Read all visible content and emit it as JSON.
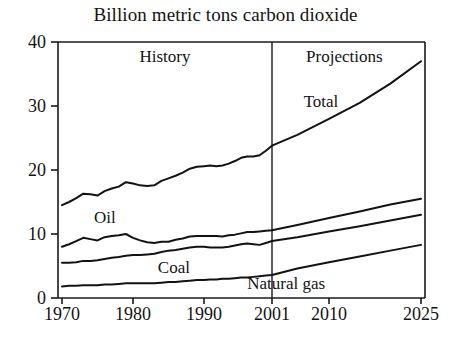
{
  "chart_data": {
    "type": "line",
    "title": "Billion metric tons carbon dioxide",
    "xlabel": "",
    "ylabel": "",
    "xlim": [
      1970,
      2025
    ],
    "ylim": [
      0,
      40
    ],
    "yticks": [
      0,
      10,
      20,
      30,
      40
    ],
    "xticks": [
      1970,
      1980,
      1990,
      2001,
      2010,
      2025
    ],
    "grid": false,
    "legend": "inline-labels",
    "annotations": [
      {
        "name": "history",
        "text": "History",
        "x": 1984.5,
        "y": 37.5
      },
      {
        "name": "projections",
        "text": "Projections",
        "x": 2012.5,
        "y": 37.5
      },
      {
        "name": "total",
        "text": "Total",
        "x": 2006,
        "y": 30.5
      },
      {
        "name": "oil",
        "text": "Oil",
        "x": 1974.5,
        "y": 12.3
      },
      {
        "name": "coal",
        "text": "Coal",
        "x": 1983.5,
        "y": 4.6
      },
      {
        "name": "natural-gas",
        "text": "Natural gas",
        "x": 1997,
        "y": 2.1
      }
    ],
    "divider": {
      "name": "history-projection-divider",
      "x": 2001
    },
    "series": [
      {
        "name": "Total",
        "x": [
          1970,
          1971,
          1972,
          1973,
          1974,
          1975,
          1976,
          1977,
          1978,
          1979,
          1980,
          1981,
          1982,
          1983,
          1984,
          1985,
          1986,
          1987,
          1988,
          1989,
          1990,
          1991,
          1992,
          1993,
          1994,
          1995,
          1996,
          1997,
          1998,
          1999,
          2000,
          2001,
          2005,
          2010,
          2015,
          2020,
          2025
        ],
        "values": [
          14.5,
          15.0,
          15.6,
          16.3,
          16.2,
          16.0,
          16.7,
          17.1,
          17.4,
          18.1,
          17.9,
          17.6,
          17.5,
          17.6,
          18.3,
          18.7,
          19.1,
          19.6,
          20.2,
          20.5,
          20.6,
          20.7,
          20.6,
          20.7,
          21.0,
          21.4,
          21.9,
          22.1,
          22.1,
          22.3,
          23.0,
          23.8,
          25.5,
          28.0,
          30.5,
          33.5,
          37.0
        ]
      },
      {
        "name": "Oil",
        "x": [
          1970,
          1971,
          1972,
          1973,
          1974,
          1975,
          1976,
          1977,
          1978,
          1979,
          1980,
          1981,
          1982,
          1983,
          1984,
          1985,
          1986,
          1987,
          1988,
          1989,
          1990,
          1991,
          1992,
          1993,
          1994,
          1995,
          1996,
          1997,
          1998,
          1999,
          2000,
          2001,
          2005,
          2010,
          2015,
          2020,
          2025
        ],
        "values": [
          8.0,
          8.4,
          8.9,
          9.4,
          9.2,
          9.0,
          9.5,
          9.7,
          9.8,
          10.0,
          9.4,
          9.0,
          8.7,
          8.6,
          8.8,
          8.8,
          9.1,
          9.3,
          9.6,
          9.7,
          9.7,
          9.7,
          9.7,
          9.6,
          9.8,
          9.9,
          10.1,
          10.3,
          10.3,
          10.4,
          10.5,
          10.6,
          11.4,
          12.5,
          13.5,
          14.6,
          15.5
        ]
      },
      {
        "name": "Coal",
        "x": [
          1970,
          1971,
          1972,
          1973,
          1974,
          1975,
          1976,
          1977,
          1978,
          1979,
          1980,
          1981,
          1982,
          1983,
          1984,
          1985,
          1986,
          1987,
          1988,
          1989,
          1990,
          1991,
          1992,
          1993,
          1994,
          1995,
          1996,
          1997,
          1998,
          1999,
          2000,
          2001,
          2005,
          2010,
          2015,
          2020,
          2025
        ],
        "values": [
          5.5,
          5.5,
          5.6,
          5.8,
          5.8,
          5.9,
          6.1,
          6.3,
          6.4,
          6.6,
          6.7,
          6.7,
          6.8,
          6.9,
          7.2,
          7.4,
          7.5,
          7.7,
          7.9,
          8.0,
          8.0,
          7.9,
          7.9,
          7.9,
          8.0,
          8.2,
          8.4,
          8.5,
          8.4,
          8.3,
          8.6,
          8.9,
          9.5,
          10.4,
          11.2,
          12.1,
          13.0
        ]
      },
      {
        "name": "Natural gas",
        "x": [
          1970,
          1971,
          1972,
          1973,
          1974,
          1975,
          1976,
          1977,
          1978,
          1979,
          1980,
          1981,
          1982,
          1983,
          1984,
          1985,
          1986,
          1987,
          1988,
          1989,
          1990,
          1991,
          1992,
          1993,
          1994,
          1995,
          1996,
          1997,
          1998,
          1999,
          2000,
          2001,
          2005,
          2010,
          2015,
          2020,
          2025
        ],
        "values": [
          1.8,
          1.9,
          1.9,
          2.0,
          2.0,
          2.0,
          2.1,
          2.1,
          2.2,
          2.3,
          2.3,
          2.3,
          2.3,
          2.3,
          2.4,
          2.5,
          2.5,
          2.6,
          2.7,
          2.8,
          2.8,
          2.9,
          2.9,
          3.0,
          3.0,
          3.1,
          3.2,
          3.2,
          3.3,
          3.4,
          3.5,
          3.6,
          4.6,
          5.6,
          6.5,
          7.4,
          8.3
        ]
      }
    ]
  }
}
